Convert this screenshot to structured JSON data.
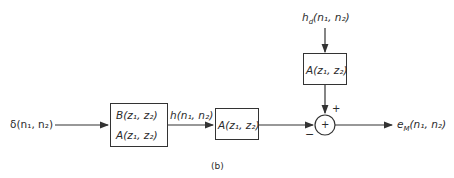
{
  "diagram": {
    "caption": "(b)",
    "input_label": "δ(n₁, n₂)",
    "filter_box": {
      "numerator": "B(z₁, z₂)",
      "denominator": "A(z₁, z₂)"
    },
    "intermediate_label": "h(n₁, n₂)",
    "lower_box": "A(z₁, z₂)",
    "desired_label": "h_d(n₁, n₂)",
    "desired_label_main": "h",
    "desired_label_sub": "d",
    "desired_label_args": "(n₁, n₂)",
    "upper_box": "A(z₁, z₂)",
    "summer": {
      "symbol": "+",
      "plus_sign": "+",
      "minus_sign": "−"
    },
    "output_label_main": "e",
    "output_label_sub": "M",
    "output_label_args": "(n₁, n₂)"
  }
}
